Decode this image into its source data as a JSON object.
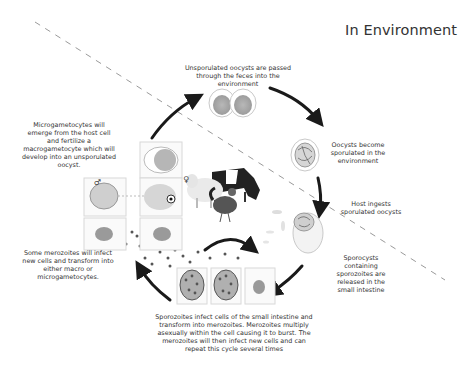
{
  "header": {
    "title": "In Environment"
  },
  "labels": {
    "unsporulated": "Unsporulated oocysts are passed through the feces into the environment",
    "sporulated": "Oocysts become sporulated in the environment",
    "ingests": "Host ingests sporulated oocysts",
    "sporocysts": "Sporocysts containing sporozoites are released in the small intestine",
    "sporozoites": "Sporozoites infect cells of the small intestine and transform into merozoites. Merozoites multiply asexually within the cell causing it to burst. The merozoites will then infect new cells and can repeat this cycle several times",
    "merozoites": "Some merozoites will infect new cells and transform into either macro or microgametocytes.",
    "microgametocytes": "Microgametocytes will emerge from the host cell and fertilize a macrogametocyte which will develop into an unsporulated oocyst."
  },
  "symbols": {
    "male": "♂",
    "female": "♀"
  },
  "hosts": [
    "cow",
    "sheep",
    "chicken"
  ],
  "colors": {
    "arrow": "#1a1a1a",
    "dash": "#9a9a9a",
    "cell": "#c8c8c8",
    "nucleus": "#8a8a8a",
    "text": "#333333"
  }
}
